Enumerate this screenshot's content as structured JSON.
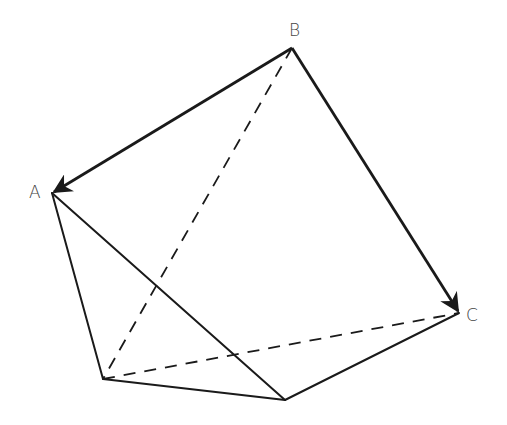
{
  "diagram": {
    "type": "polyhedron-vectors",
    "labels": {
      "A": "A",
      "B": "B",
      "C": "C"
    },
    "vertices": {
      "A": [
        52,
        193
      ],
      "B": [
        292,
        48
      ],
      "C": [
        459,
        313
      ],
      "D": [
        103,
        379
      ],
      "E": [
        285,
        400
      ]
    },
    "vectors": [
      {
        "from": "B",
        "to": "A"
      },
      {
        "from": "B",
        "to": "C"
      }
    ],
    "solid_edges": [
      [
        "A",
        "D"
      ],
      [
        "A",
        "E"
      ],
      [
        "D",
        "E"
      ],
      [
        "E",
        "C"
      ]
    ],
    "dashed_edges": [
      [
        "B",
        "D"
      ],
      [
        "D",
        "C"
      ]
    ],
    "colors": {
      "stroke": "#1a1a1a",
      "label": "#444444",
      "background": "#ffffff"
    }
  }
}
